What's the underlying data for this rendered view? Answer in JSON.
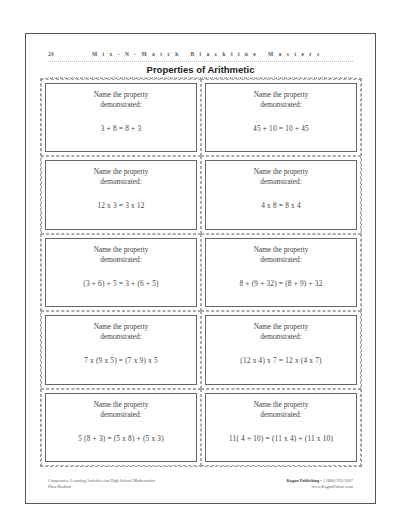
{
  "header": {
    "page_number": "24",
    "series_title": "Mix-N-Match Blackline Masters"
  },
  "title": "Properties of Arithmetic",
  "cards": [
    {
      "prompt_line1": "Name the property",
      "prompt_line2": "demonstrated:",
      "expression": "3 + 8 = 8 + 3"
    },
    {
      "prompt_line1": "Name the property",
      "prompt_line2": "demonstrated:",
      "expression": "45 + 10 = 10 + 45"
    },
    {
      "prompt_line1": "Name the property",
      "prompt_line2": "demonstrated:",
      "expression": "12 x 3 = 3 x 12"
    },
    {
      "prompt_line1": "Name the property",
      "prompt_line2": "demonstrated:",
      "expression": "4 x 8 = 8 x 4"
    },
    {
      "prompt_line1": "Name the property",
      "prompt_line2": "demonstrated:",
      "expression": "(3 + 6) + 5 = 3 + (6 + 5)"
    },
    {
      "prompt_line1": "Name the property",
      "prompt_line2": "demonstrated:",
      "expression": "8 + (9 + 32) = (8 + 9) + 32"
    },
    {
      "prompt_line1": "Name the property",
      "prompt_line2": "demonstrated:",
      "expression": "7 x (9 x 5) = (7 x 9) x 5"
    },
    {
      "prompt_line1": "Name the property",
      "prompt_line2": "demonstrated:",
      "expression": "(12 x 4) x 7 = 12 x (4 x 7)"
    },
    {
      "prompt_line1": "Name the property",
      "prompt_line2": "demonstrated:",
      "expression": "5 (8 + 3) = (5 x 8) + (5 x 3)"
    },
    {
      "prompt_line1": "Name the property",
      "prompt_line2": "demonstrated:",
      "expression": "11( 4 + 10) = (11 x 4) + (11 x 10)"
    }
  ],
  "footer": {
    "book_title": "Cooperative Learning Activities for High School Mathematics",
    "author": "Dina Kushnir",
    "publisher": "Kagan Publishing",
    "phone": "• 1 (800) 933-2667",
    "website": "www.KaganOnline.com"
  }
}
